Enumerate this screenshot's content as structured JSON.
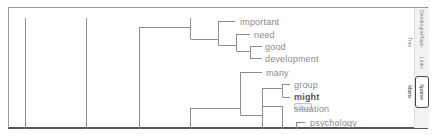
{
  "view": {
    "type": "dendrogram",
    "line_color": "#8c8c8c",
    "label_color": "#8a8a8a"
  },
  "leaves": [
    {
      "label": "important"
    },
    {
      "label": "need"
    },
    {
      "label": "good"
    },
    {
      "label": "development"
    },
    {
      "label": "many"
    },
    {
      "label": "group"
    },
    {
      "label": "might",
      "selected": true
    },
    {
      "label": "situation"
    },
    {
      "label": "psychology"
    }
  ],
  "side_tabs": [
    {
      "label": "Dendrogram",
      "active": false
    },
    {
      "label": "Topic Tree",
      "active": false
    },
    {
      "label": "Links",
      "active": false
    },
    {
      "label": "Sparse Matrix",
      "active": true
    }
  ]
}
